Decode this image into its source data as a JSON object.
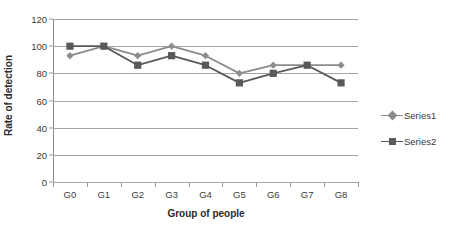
{
  "chart_data": {
    "type": "line",
    "title": "",
    "xlabel": "Group of people",
    "ylabel": "Rate of detection",
    "categories": [
      "G0",
      "G1",
      "G2",
      "G3",
      "G4",
      "G5",
      "G6",
      "G7",
      "G8"
    ],
    "ylim": [
      0,
      120
    ],
    "yticks": [
      0,
      20,
      40,
      60,
      80,
      100,
      120
    ],
    "ytick_labels": [
      "0",
      "20",
      "40",
      "60",
      "80",
      "100",
      "120"
    ],
    "grid": "horizontal",
    "legend_position": "right",
    "series": [
      {
        "name": "Series1",
        "marker": "diamond",
        "color": "#8c8c8c",
        "values": [
          93,
          100,
          93,
          100,
          93,
          80,
          86,
          86,
          86
        ]
      },
      {
        "name": "Series2",
        "marker": "square",
        "color": "#595959",
        "values": [
          100,
          100,
          86,
          93,
          86,
          73,
          80,
          86,
          73
        ]
      }
    ]
  },
  "legend": {
    "items": [
      {
        "label": "Series1"
      },
      {
        "label": "Series2"
      }
    ]
  },
  "colors": {
    "series1": "#8c8c8c",
    "series2": "#595959",
    "gridline": "#a6a6a6",
    "axis": "#8a8a8a",
    "text": "#3a3a3a",
    "background": "#ffffff"
  }
}
